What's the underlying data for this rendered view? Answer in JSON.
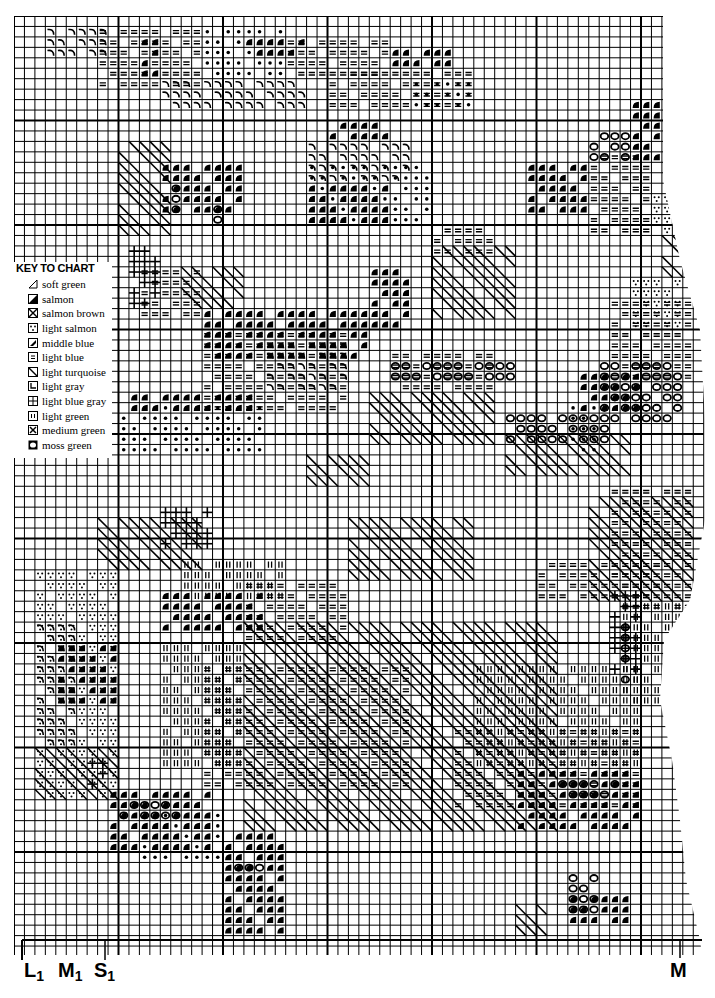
{
  "key": {
    "title": "KEY TO CHART",
    "items": [
      {
        "symbol": "half-slash",
        "label": "soft green"
      },
      {
        "symbol": "half-solid",
        "label": "salmon"
      },
      {
        "symbol": "box-x-dots",
        "label": "salmon brown"
      },
      {
        "symbol": "box-dots-v",
        "label": "light salmon"
      },
      {
        "symbol": "box-slash-solid",
        "label": "middle blue"
      },
      {
        "symbol": "box-lines",
        "label": "light blue"
      },
      {
        "symbol": "box-backslash",
        "label": "light turquoise"
      },
      {
        "symbol": "box-corner",
        "label": "light gray"
      },
      {
        "symbol": "box-plus-dots",
        "label": "light blue gray"
      },
      {
        "symbol": "box-ii",
        "label": "light green"
      },
      {
        "symbol": "box-x",
        "label": "medium green"
      },
      {
        "symbol": "circle",
        "label": "moss green"
      }
    ]
  },
  "markers": {
    "bottom_left": [
      {
        "letter": "L",
        "sub": "1"
      },
      {
        "letter": "M",
        "sub": "1"
      },
      {
        "letter": "S",
        "sub": "1"
      }
    ],
    "bottom_right": {
      "letter": "M"
    }
  },
  "grid": {
    "origin_x": 14,
    "origin_y": 16,
    "cell": 10.45,
    "cols": 66,
    "rows": 90,
    "heavy_every": 10,
    "line_color": "#000000"
  },
  "patches": [
    {
      "sym": "arc",
      "c": 3,
      "r": 1,
      "w": 6,
      "h": 3
    },
    {
      "sym": "lines",
      "c": 8,
      "r": 1,
      "w": 10,
      "h": 6
    },
    {
      "sym": "dot",
      "c": 18,
      "r": 1,
      "w": 8,
      "h": 5
    },
    {
      "sym": "half",
      "c": 12,
      "r": 2,
      "w": 2,
      "h": 4
    },
    {
      "sym": "half",
      "c": 22,
      "r": 2,
      "w": 6,
      "h": 2
    },
    {
      "sym": "lines",
      "c": 26,
      "r": 2,
      "w": 10,
      "h": 4
    },
    {
      "sym": "half",
      "c": 36,
      "r": 3,
      "w": 6,
      "h": 2
    },
    {
      "sym": "lines",
      "c": 30,
      "r": 5,
      "w": 14,
      "h": 4
    },
    {
      "sym": "arc",
      "c": 14,
      "r": 6,
      "w": 14,
      "h": 3
    },
    {
      "sym": "dot",
      "c": 38,
      "r": 6,
      "w": 6,
      "h": 3
    },
    {
      "sym": "half",
      "c": 30,
      "r": 10,
      "w": 6,
      "h": 2
    },
    {
      "sym": "arc",
      "c": 28,
      "r": 12,
      "w": 10,
      "h": 4
    },
    {
      "sym": "xslash",
      "c": 10,
      "r": 12,
      "w": 5,
      "h": 9
    },
    {
      "sym": "half",
      "c": 14,
      "r": 14,
      "w": 8,
      "h": 5
    },
    {
      "sym": "circle",
      "c": 15,
      "r": 15,
      "w": 1,
      "h": 4
    },
    {
      "sym": "circle",
      "c": 19,
      "r": 18,
      "w": 1,
      "h": 3
    },
    {
      "sym": "dot",
      "c": 28,
      "r": 14,
      "w": 12,
      "h": 6
    },
    {
      "sym": "half",
      "c": 28,
      "r": 16,
      "w": 8,
      "h": 4
    },
    {
      "sym": "circle",
      "c": 55,
      "r": 11,
      "w": 4,
      "h": 3
    },
    {
      "sym": "half",
      "c": 49,
      "r": 14,
      "w": 6,
      "h": 5
    },
    {
      "sym": "lines",
      "c": 55,
      "r": 13,
      "w": 6,
      "h": 8
    },
    {
      "sym": "half",
      "c": 59,
      "r": 8,
      "w": 3,
      "h": 6
    },
    {
      "sym": "dotsv",
      "c": 61,
      "r": 17,
      "w": 3,
      "h": 4
    },
    {
      "sym": "xslash",
      "c": 62,
      "r": 21,
      "w": 2,
      "h": 4
    },
    {
      "sym": "dotsv",
      "c": 59,
      "r": 25,
      "w": 5,
      "h": 5
    },
    {
      "sym": "lines",
      "c": 57,
      "r": 27,
      "w": 8,
      "h": 8
    },
    {
      "sym": "plus",
      "c": 11,
      "r": 22,
      "w": 3,
      "h": 6
    },
    {
      "sym": "lines",
      "c": 12,
      "r": 24,
      "w": 6,
      "h": 5
    },
    {
      "sym": "xslash",
      "c": 16,
      "r": 24,
      "w": 6,
      "h": 4
    },
    {
      "sym": "half",
      "c": 18,
      "r": 28,
      "w": 16,
      "h": 5
    },
    {
      "sym": "lines",
      "c": 18,
      "r": 30,
      "w": 14,
      "h": 8
    },
    {
      "sym": "arc",
      "c": 24,
      "r": 31,
      "w": 8,
      "h": 5
    },
    {
      "sym": "half",
      "c": 34,
      "r": 24,
      "w": 4,
      "h": 6
    },
    {
      "sym": "xslash",
      "c": 40,
      "r": 22,
      "w": 8,
      "h": 7
    },
    {
      "sym": "lines",
      "c": 40,
      "r": 20,
      "w": 6,
      "h": 3
    },
    {
      "sym": "half",
      "c": 11,
      "r": 36,
      "w": 12,
      "h": 2
    },
    {
      "sym": "dot",
      "c": 10,
      "r": 37,
      "w": 14,
      "h": 5
    },
    {
      "sym": "lines",
      "c": 36,
      "r": 32,
      "w": 10,
      "h": 4
    },
    {
      "sym": "circle",
      "c": 36,
      "r": 33,
      "w": 12,
      "h": 2
    },
    {
      "sym": "xslash",
      "c": 34,
      "r": 36,
      "w": 12,
      "h": 5
    },
    {
      "sym": "circle",
      "c": 47,
      "r": 38,
      "w": 10,
      "h": 3
    },
    {
      "sym": "xslash",
      "c": 47,
      "r": 40,
      "w": 12,
      "h": 4
    },
    {
      "sym": "circle",
      "c": 56,
      "r": 33,
      "w": 8,
      "h": 6
    },
    {
      "sym": "half",
      "c": 54,
      "r": 34,
      "w": 6,
      "h": 4
    },
    {
      "sym": "dot",
      "c": 53,
      "r": 37,
      "w": 3,
      "h": 5
    },
    {
      "sym": "xslash",
      "c": 28,
      "r": 42,
      "w": 6,
      "h": 3
    },
    {
      "sym": "xslash",
      "c": 8,
      "r": 48,
      "w": 10,
      "h": 5
    },
    {
      "sym": "plus",
      "c": 14,
      "r": 47,
      "w": 5,
      "h": 4
    },
    {
      "sym": "xslash",
      "c": 32,
      "r": 48,
      "w": 12,
      "h": 6
    },
    {
      "sym": "lines",
      "c": 57,
      "r": 45,
      "w": 8,
      "h": 12
    },
    {
      "sym": "xslash",
      "c": 55,
      "r": 46,
      "w": 10,
      "h": 10
    },
    {
      "sym": "lines",
      "c": 50,
      "r": 52,
      "w": 12,
      "h": 4
    },
    {
      "sym": "ii",
      "c": 58,
      "r": 56,
      "w": 6,
      "h": 10
    },
    {
      "sym": "plus",
      "c": 57,
      "r": 55,
      "w": 3,
      "h": 8
    },
    {
      "sym": "circle",
      "c": 58,
      "r": 58,
      "w": 1,
      "h": 6
    },
    {
      "sym": "ii",
      "c": 16,
      "r": 52,
      "w": 10,
      "h": 4
    },
    {
      "sym": "half",
      "c": 14,
      "r": 55,
      "w": 10,
      "h": 4
    },
    {
      "sym": "lines",
      "c": 22,
      "r": 54,
      "w": 10,
      "h": 6
    },
    {
      "sym": "xslash",
      "c": 22,
      "r": 58,
      "w": 30,
      "h": 20
    },
    {
      "sym": "lines",
      "c": 18,
      "r": 62,
      "w": 20,
      "h": 12
    },
    {
      "sym": "ii",
      "c": 14,
      "r": 60,
      "w": 8,
      "h": 12
    },
    {
      "sym": "dotsv",
      "c": 2,
      "r": 53,
      "w": 8,
      "h": 22
    },
    {
      "sym": "arc",
      "c": 2,
      "r": 58,
      "w": 4,
      "h": 12
    },
    {
      "sym": "half",
      "c": 4,
      "r": 60,
      "w": 6,
      "h": 6
    },
    {
      "sym": "xslash",
      "c": 2,
      "r": 70,
      "w": 8,
      "h": 5
    },
    {
      "sym": "plus",
      "c": 7,
      "r": 71,
      "w": 2,
      "h": 3
    },
    {
      "sym": "ii",
      "c": 44,
      "r": 62,
      "w": 16,
      "h": 10
    },
    {
      "sym": "lines",
      "c": 42,
      "r": 68,
      "w": 18,
      "h": 8
    },
    {
      "sym": "half",
      "c": 48,
      "r": 72,
      "w": 12,
      "h": 6
    },
    {
      "sym": "circle",
      "c": 52,
      "r": 73,
      "w": 6,
      "h": 2
    },
    {
      "sym": "half",
      "c": 9,
      "r": 74,
      "w": 10,
      "h": 6
    },
    {
      "sym": "circle",
      "c": 10,
      "r": 75,
      "w": 6,
      "h": 2
    },
    {
      "sym": "dot",
      "c": 12,
      "r": 76,
      "w": 8,
      "h": 5
    },
    {
      "sym": "half",
      "c": 20,
      "r": 78,
      "w": 6,
      "h": 10
    },
    {
      "sym": "circle",
      "c": 20,
      "r": 81,
      "w": 4,
      "h": 1
    },
    {
      "sym": "circle",
      "c": 53,
      "r": 82,
      "w": 3,
      "h": 4
    },
    {
      "sym": "half",
      "c": 53,
      "r": 84,
      "w": 6,
      "h": 3
    },
    {
      "sym": "xslash",
      "c": 48,
      "r": 85,
      "w": 3,
      "h": 3
    }
  ]
}
